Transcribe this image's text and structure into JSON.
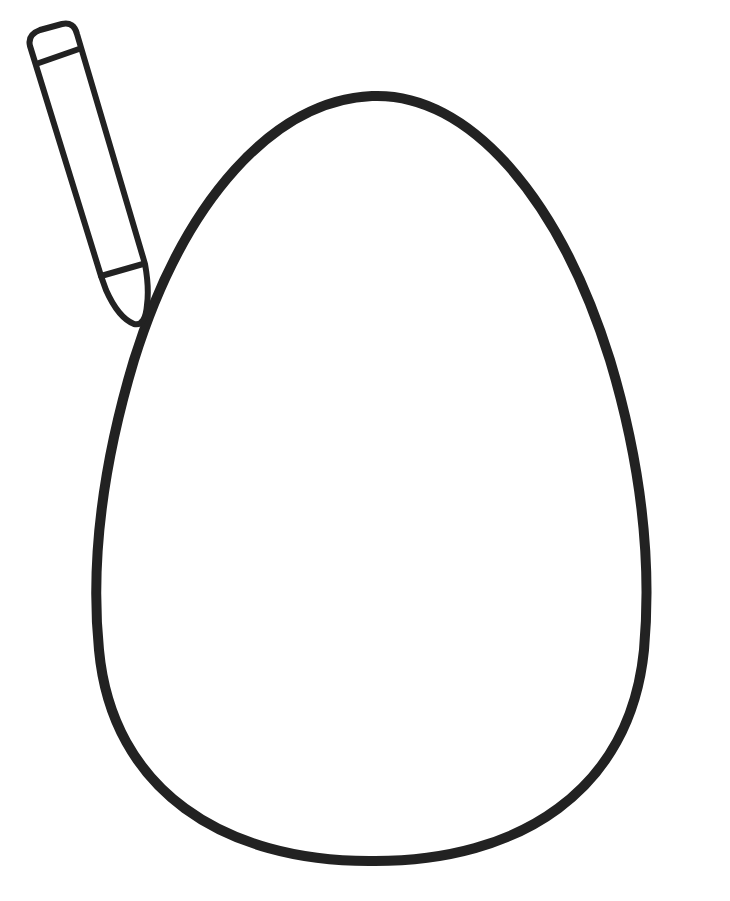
{
  "page": {
    "title": "Egg coloring page",
    "background": "#ffffff"
  },
  "drawing": {
    "stroke_color": "#222222",
    "egg": {
      "label": "egg outline",
      "stroke_width": 10,
      "top_y": 96,
      "bottom_y": 861,
      "left_x": 95,
      "right_x": 648,
      "center_x": 372
    },
    "crayon": {
      "label": "crayon",
      "stroke_width": 6
    }
  }
}
